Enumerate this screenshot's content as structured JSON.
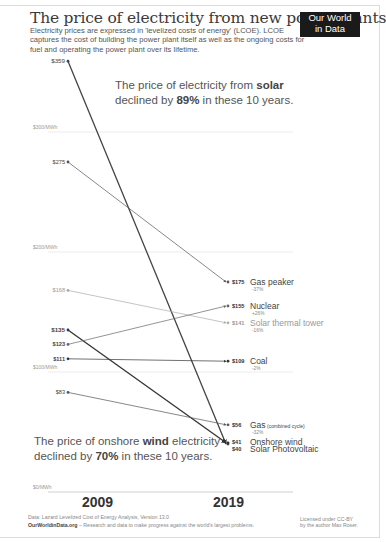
{
  "header": {
    "title": "The price of electricity from new power plants",
    "subtitle": "Electricity prices are expressed in 'levelized costs of energy' (LCOE). LCOE captures the cost of building the power plant itself as well as the ongoing costs for fuel and operating the power plant over its lifetime.",
    "logo_line1": "Our World",
    "logo_line2": "in Data"
  },
  "annotations": {
    "solar_pre": "The price of electricity from ",
    "solar_bold": "solar",
    "solar_line2_pre": "declined by ",
    "solar_pct": "89%",
    "solar_line2_post": " in these 10 years.",
    "wind_pre": "The price of onshore ",
    "wind_bold": "wind",
    "wind_post": " electricity",
    "wind_line2_pre": "declined by ",
    "wind_pct": "70%",
    "wind_line2_post": " in these 10 years."
  },
  "axis": {
    "gridlines": [
      "$300/MWh",
      "$200/MWh",
      "$100/MWh",
      "$0/MWh"
    ],
    "years": [
      "2009",
      "2019"
    ]
  },
  "footer": {
    "source": "Data: Lazard Levelized Cost of Energy Analysis, Version 13.0",
    "site": "OurWorldinData.org",
    "tagline": " – Research and data to make progress against the world's largest problems.",
    "license1": "Licensed under CC-BY",
    "license2": "by the author Max Roser."
  },
  "chart_data": {
    "type": "line",
    "title": "The price of electricity from new power plants",
    "subtitle": "Levelized costs of energy (LCOE), $/MWh",
    "x": [
      "2009",
      "2019"
    ],
    "ylabel": "$/MWh",
    "ylim": [
      0,
      360
    ],
    "yticks": [
      "$0/MWh",
      "$100/MWh",
      "$200/MWh",
      "$300/MWh"
    ],
    "grid": true,
    "series": [
      {
        "name": "Solar Photovoltaic",
        "values": [
          359,
          40
        ],
        "label_2009": "$359",
        "label_2019": "$40",
        "change": "-89%",
        "color": "#444444",
        "bold": true
      },
      {
        "name": "Gas peaker",
        "values": [
          275,
          175
        ],
        "label_2009": "$275",
        "label_2019": "$175",
        "change": "-37%",
        "color": "#555555"
      },
      {
        "name": "Solar thermal tower",
        "values": [
          168,
          141
        ],
        "label_2009": "$168",
        "label_2019": "$141",
        "change": "-16%",
        "color": "#aaaaaa"
      },
      {
        "name": "Onshore wind",
        "values": [
          135,
          41
        ],
        "label_2009": "$135",
        "label_2019": "$41",
        "change": "-70%",
        "color": "#333333",
        "bold": true
      },
      {
        "name": "Nuclear",
        "values": [
          123,
          155
        ],
        "label_2009": "$123",
        "label_2019": "$155",
        "change": "+26%",
        "color": "#666666"
      },
      {
        "name": "Coal",
        "values": [
          111,
          109
        ],
        "label_2009": "$111",
        "label_2019": "$109",
        "change": "-2%",
        "color": "#333333"
      },
      {
        "name": "Gas",
        "name_suffix": "(combined cycle)",
        "values": [
          83,
          56
        ],
        "label_2009": "$83",
        "label_2019": "$56",
        "change": "-32%",
        "color": "#555555"
      }
    ]
  }
}
